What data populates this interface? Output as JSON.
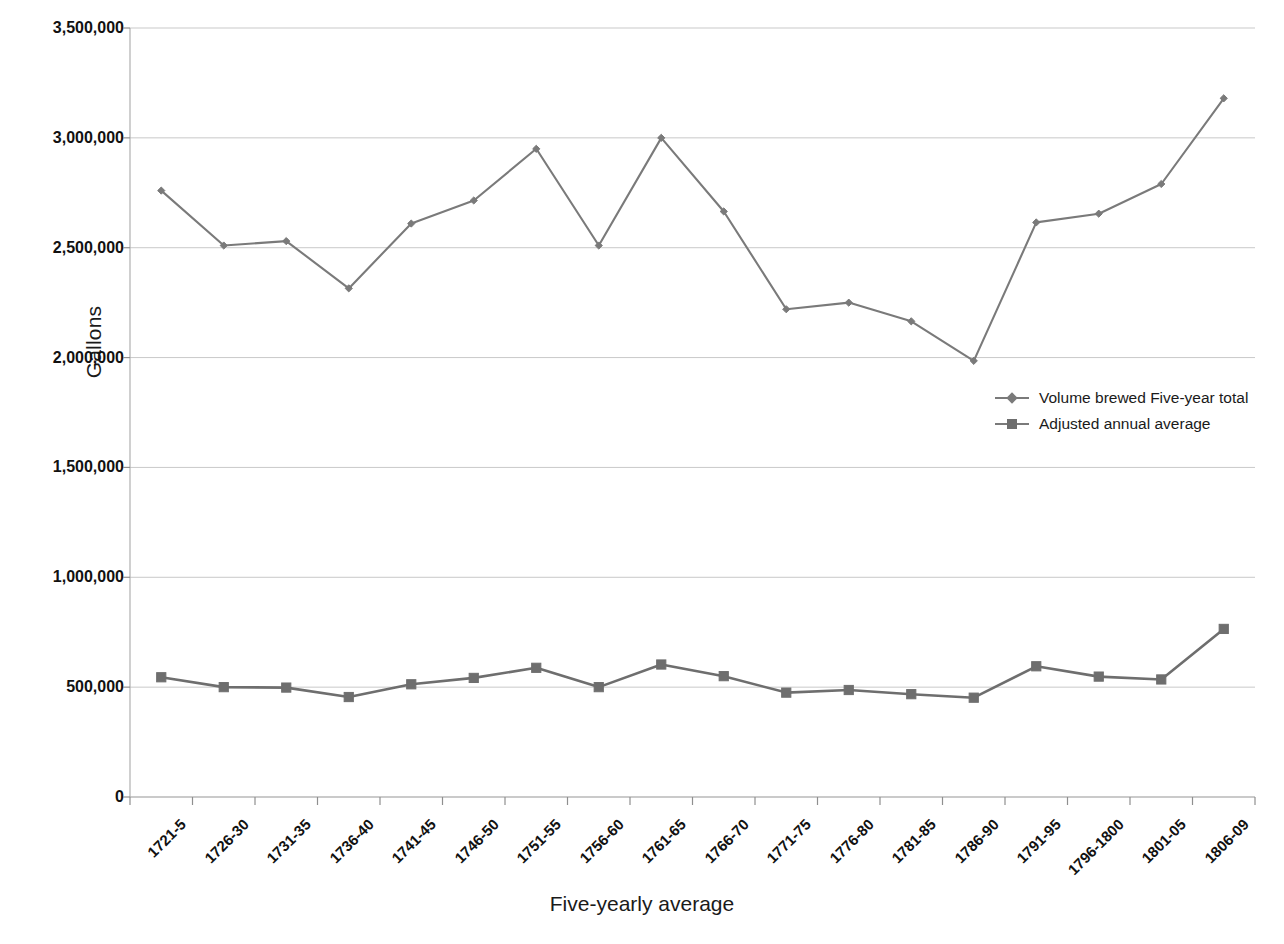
{
  "chart_data": {
    "type": "line",
    "title": "",
    "xlabel": "Five-yearly average",
    "ylabel": "Gallons",
    "ylim": [
      0,
      3500000
    ],
    "ytick_labels": [
      "3,500,000",
      "3,000,000",
      "2,500,000",
      "2,000,000",
      "1,500,000",
      "1,000,000",
      "500,000",
      "0"
    ],
    "ytick_values": [
      3500000,
      3000000,
      2500000,
      2000000,
      1500000,
      1000000,
      500000,
      0
    ],
    "grid": true,
    "legend_position": "inside-right",
    "categories": [
      "1721-5",
      "1726-30",
      "1731-35",
      "1736-40",
      "1741-45",
      "1746-50",
      "1751-55",
      "1756-60",
      "1761-65",
      "1766-70",
      "1771-75",
      "1776-80",
      "1781-85",
      "1786-90",
      "1791-95",
      "1796-1800",
      "1801-05",
      "1806-09"
    ],
    "series": [
      {
        "name": "Volume brewed Five-year total",
        "marker": "diamond",
        "color": "#7a7a7a",
        "values": [
          2760000,
          2510000,
          2530000,
          2315000,
          2610000,
          2715000,
          2950000,
          2510000,
          3000000,
          2665000,
          2220000,
          2250000,
          2165000,
          1985000,
          2615000,
          2655000,
          2790000,
          3180000
        ]
      },
      {
        "name": "Adjusted annual average",
        "marker": "square",
        "color": "#6e6e6e",
        "values": [
          545000,
          500000,
          498000,
          455000,
          513000,
          542000,
          588000,
          500000,
          603000,
          550000,
          475000,
          487000,
          468000,
          452000,
          595000,
          548000,
          535000,
          765000
        ]
      }
    ]
  },
  "legend": {
    "items": [
      {
        "label": "Volume brewed Five-year total"
      },
      {
        "label": "Adjusted annual average"
      }
    ]
  },
  "axes": {
    "y_title": "Gallons",
    "x_title": "Five-yearly average"
  }
}
